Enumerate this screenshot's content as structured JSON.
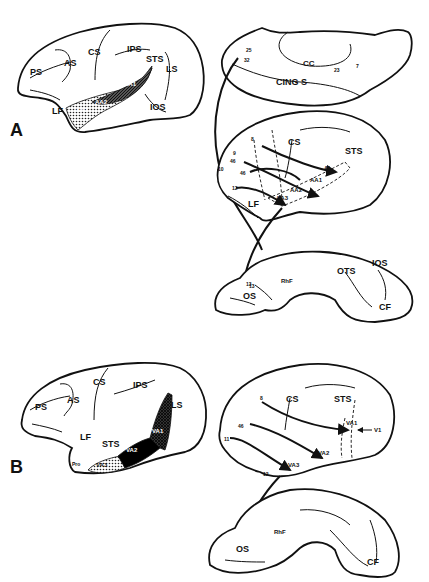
{
  "figure": {
    "panel_a": {
      "label": "A",
      "lateral_brain": {
        "sulci": [
          "PS",
          "AS",
          "CS",
          "IPS",
          "STS",
          "LS",
          "LF",
          "IOS"
        ],
        "areas": [
          "AA1",
          "AA2",
          "AA3"
        ]
      },
      "medial_brain": {
        "labels": [
          "25",
          "32",
          "CC",
          "23",
          "7",
          "CING S"
        ]
      },
      "projection_brain": {
        "labels": [
          "8",
          "9",
          "46",
          "10",
          "46",
          "12",
          "CS",
          "STS",
          "AI",
          "AA1",
          "AA2",
          "AA3",
          "LF"
        ]
      },
      "ventral_brain": {
        "labels": [
          "13",
          "13",
          "OS",
          "RhF",
          "OTS",
          "IOS",
          "CF"
        ]
      }
    },
    "panel_b": {
      "label": "B",
      "lateral_brain": {
        "sulci": [
          "PS",
          "AS",
          "CS",
          "IPS",
          "LS",
          "LF",
          "STS"
        ],
        "areas": [
          "VA1",
          "VA2",
          "VA3",
          "Pro"
        ]
      },
      "projection_brain": {
        "labels": [
          "8",
          "CS",
          "STS",
          "VA1",
          "V1",
          "46",
          "11",
          "VA2",
          "VA3",
          "12"
        ]
      },
      "ventral_brain": {
        "labels": [
          "OS",
          "RhF",
          "CF"
        ]
      }
    }
  }
}
